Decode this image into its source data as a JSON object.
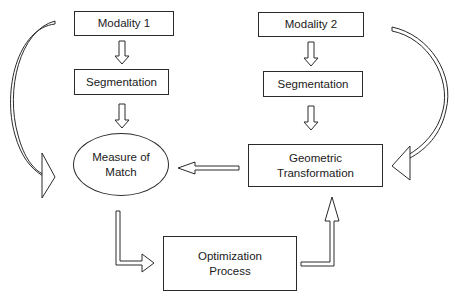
{
  "diagram": {
    "nodes": {
      "modality1": {
        "label": "Modality 1",
        "shape": "rectangle"
      },
      "segmentation1": {
        "label": "Segmentation",
        "shape": "rectangle"
      },
      "modality2": {
        "label": "Modality 2",
        "shape": "rectangle"
      },
      "segmentation2": {
        "label": "Segmentation",
        "shape": "rectangle"
      },
      "measure_of_match": {
        "line1": "Measure of",
        "line2": "Match",
        "shape": "ellipse"
      },
      "geometric_transformation": {
        "line1": "Geometric",
        "line2": "Transformation",
        "shape": "rectangle"
      },
      "optimization_process": {
        "line1": "Optimization",
        "line2": "Process",
        "shape": "rectangle"
      }
    },
    "edges": [
      {
        "from": "Modality 1",
        "to": "Segmentation",
        "style": "hollow-arrow"
      },
      {
        "from": "Segmentation",
        "to": "Measure of Match",
        "style": "hollow-arrow"
      },
      {
        "from": "Modality 2",
        "to": "Segmentation",
        "style": "hollow-arrow"
      },
      {
        "from": "Segmentation",
        "to": "Geometric Transformation",
        "style": "hollow-arrow"
      },
      {
        "from": "Geometric Transformation",
        "to": "Measure of Match",
        "style": "hollow-arrow"
      },
      {
        "from": "Measure of Match",
        "to": "Optimization Process",
        "style": "hollow-elbow-arrow"
      },
      {
        "from": "Optimization Process",
        "to": "Geometric Transformation",
        "style": "hollow-elbow-arrow"
      },
      {
        "from": "Modality 1",
        "to": "Measure of Match",
        "style": "hollow-curved-arrow"
      },
      {
        "from": "Modality 2",
        "to": "Geometric Transformation",
        "style": "hollow-curved-arrow"
      }
    ],
    "colors": {
      "stroke": "#2a2a2a",
      "background": "#ffffff"
    }
  }
}
